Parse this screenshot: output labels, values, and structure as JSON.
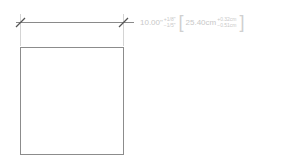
{
  "drawing": {
    "shape": "square",
    "stroke_color": "#888888",
    "dimension_line_color": "#777777",
    "extension_line_color": "#cccccc",
    "text_color": "#c8c8c8"
  },
  "dimension": {
    "imperial_value": "10.00\"",
    "imperial_plus": "+1/8\"",
    "imperial_minus": "−1/5\"",
    "bracket_open": "[",
    "bracket_close": "]",
    "metric_value": "25.40cm",
    "metric_plus": "+0.32cm",
    "metric_minus": "−0.51cm"
  }
}
